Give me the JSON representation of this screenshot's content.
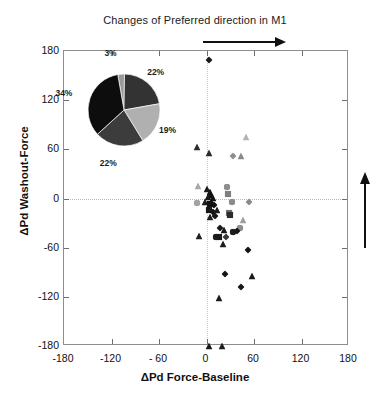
{
  "chart_data": {
    "type": "scatter",
    "title": "Changes of Preferred direction in M1",
    "xlabel": "ΔPd Force-Baseline",
    "ylabel": "ΔPd Washout-Force",
    "xlim": [
      -180,
      180
    ],
    "ylim": [
      -180,
      180
    ],
    "xticks": [
      -180,
      -120,
      -60,
      0,
      60,
      120,
      180
    ],
    "xticklabels": [
      "-180",
      "-120",
      "- 60",
      "0",
      "60",
      "120",
      "180"
    ],
    "yticks": [
      -180,
      -120,
      -60,
      0,
      60,
      120,
      180
    ],
    "yticklabels": [
      "-180",
      "-120",
      "-60",
      "0",
      "60",
      "120",
      "180"
    ],
    "grid": false,
    "reference_lines": {
      "vertical_x": 0,
      "horizontal_y": 0,
      "style": "dotted"
    },
    "legend": null,
    "points": [
      {
        "x": 3,
        "y": 178,
        "shape": "diamond",
        "color": "#1a1a1a"
      },
      {
        "x": 50,
        "y": 84,
        "shape": "triangle",
        "color": "#b4b4b4"
      },
      {
        "x": -12,
        "y": 72,
        "shape": "triangle",
        "color": "#2d2d2d"
      },
      {
        "x": 3,
        "y": 64,
        "shape": "triangle",
        "color": "#2b2b2b"
      },
      {
        "x": 33,
        "y": 60,
        "shape": "diamond",
        "color": "#8f8f8f"
      },
      {
        "x": 43,
        "y": 60,
        "shape": "triangle",
        "color": "#8a8a8a"
      },
      {
        "x": -11,
        "y": 24,
        "shape": "triangle",
        "color": "#a9a9a9"
      },
      {
        "x": -12,
        "y": 3,
        "shape": "circle",
        "color": "#a3a3a3"
      },
      {
        "x": 26,
        "y": 22,
        "shape": "circle",
        "color": "#8d8d8d"
      },
      {
        "x": 27,
        "y": 14,
        "shape": "square",
        "color": "#7f7f7f"
      },
      {
        "x": 32,
        "y": 4,
        "shape": "circle",
        "color": "#8b8b8b"
      },
      {
        "x": 54,
        "y": 4,
        "shape": "diamond",
        "color": "#8a8a8a"
      },
      {
        "x": 1,
        "y": 20,
        "shape": "triangle",
        "color": "#1c1c1c"
      },
      {
        "x": 4,
        "y": 17,
        "shape": "triangle",
        "color": "#151515"
      },
      {
        "x": 6,
        "y": 13,
        "shape": "triangle",
        "color": "#101010"
      },
      {
        "x": 2,
        "y": 10,
        "shape": "triangle",
        "color": "#181818"
      },
      {
        "x": 8,
        "y": 9,
        "shape": "triangle",
        "color": "#121212"
      },
      {
        "x": -2,
        "y": 4,
        "shape": "triangle",
        "color": "#1f1f1f"
      },
      {
        "x": 5,
        "y": 2,
        "shape": "square",
        "color": "#141414"
      },
      {
        "x": 10,
        "y": 1,
        "shape": "diamond",
        "color": "#111111"
      },
      {
        "x": 3,
        "y": -5,
        "shape": "square",
        "color": "#181818"
      },
      {
        "x": 8,
        "y": -8,
        "shape": "diamond",
        "color": "#121212"
      },
      {
        "x": 13,
        "y": -6,
        "shape": "triangle",
        "color": "#1a1a1a"
      },
      {
        "x": 11,
        "y": -13,
        "shape": "diamond",
        "color": "#161616"
      },
      {
        "x": 5,
        "y": -14,
        "shape": "triangle",
        "color": "#1d1d1d"
      },
      {
        "x": 28,
        "y": -9,
        "shape": "square",
        "color": "#6f6f6f"
      },
      {
        "x": 30,
        "y": -11,
        "shape": "square",
        "color": "#2a2a2a"
      },
      {
        "x": 46,
        "y": -18,
        "shape": "triangle",
        "color": "#a0a0a0"
      },
      {
        "x": 42,
        "y": -28,
        "shape": "circle",
        "color": "#8e8e8e"
      },
      {
        "x": 17,
        "y": -28,
        "shape": "diamond",
        "color": "#1b1b1b"
      },
      {
        "x": 22,
        "y": -30,
        "shape": "triangle",
        "color": "#191919"
      },
      {
        "x": 33,
        "y": -32,
        "shape": "circle",
        "color": "#1e1e1e"
      },
      {
        "x": 38,
        "y": -31,
        "shape": "diamond",
        "color": "#171717"
      },
      {
        "x": -9,
        "y": -37,
        "shape": "triangle",
        "color": "#202020"
      },
      {
        "x": 12,
        "y": -38,
        "shape": "circle",
        "color": "#1d1d1d"
      },
      {
        "x": 16,
        "y": -38,
        "shape": "square",
        "color": "#1a1a1a"
      },
      {
        "x": 25,
        "y": -39,
        "shape": "diamond",
        "color": "#3a3a3a"
      },
      {
        "x": 21,
        "y": -47,
        "shape": "triangle",
        "color": "#1c1c1c"
      },
      {
        "x": 52,
        "y": -54,
        "shape": "diamond",
        "color": "#151515"
      },
      {
        "x": 23,
        "y": -84,
        "shape": "diamond",
        "color": "#161616"
      },
      {
        "x": 57,
        "y": -86,
        "shape": "triangle",
        "color": "#1a1a1a"
      },
      {
        "x": 43,
        "y": -100,
        "shape": "diamond",
        "color": "#181818"
      },
      {
        "x": 16,
        "y": -113,
        "shape": "triangle",
        "color": "#1b1b1b"
      },
      {
        "x": 3,
        "y": -172,
        "shape": "triangle",
        "color": "#191919"
      },
      {
        "x": 19,
        "y": -172,
        "shape": "triangle",
        "color": "#1d1d1d"
      }
    ],
    "inset_pie": {
      "type": "pie",
      "labels": [
        "3%",
        "22%",
        "19%",
        "22%",
        "34%"
      ],
      "values": [
        3,
        22,
        19,
        22,
        34
      ],
      "colors": [
        "#9a9a9a",
        "#333333",
        "#b0b0b0",
        "#3c3c3c",
        "#0d0d0d"
      ]
    },
    "annotations": [
      {
        "name": "horizontal-arrow",
        "direction": "right"
      },
      {
        "name": "vertical-arrow",
        "direction": "up"
      }
    ]
  }
}
